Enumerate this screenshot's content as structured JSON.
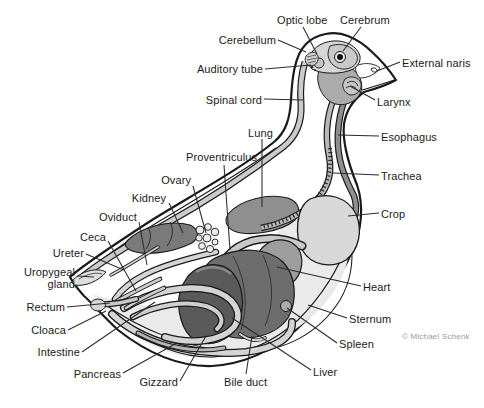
{
  "figure": {
    "credit": "© Michael Schenk"
  },
  "labels": {
    "optic_lobe": "Optic lobe",
    "cerebrum": "Cerebrum",
    "cerebellum": "Cerebellum",
    "auditory_tube": "Auditory tube",
    "external_naris": "External naris",
    "spinal_cord": "Spinal cord",
    "larynx": "Larynx",
    "esophagus": "Esophagus",
    "lung": "Lung",
    "trachea": "Trachea",
    "proventriculus": "Proventriculus",
    "ovary": "Ovary",
    "kidney": "Kidney",
    "crop": "Crop",
    "oviduct": "Oviduct",
    "ceca": "Ceca",
    "ureter": "Ureter",
    "uropygeal_gland": "Uropygeal\ngland",
    "rectum": "Rectum",
    "cloaca": "Cloaca",
    "intestine": "Intestine",
    "pancreas": "Pancreas",
    "gizzard": "Gizzard",
    "bile_duct": "Bile duct",
    "liver": "Liver",
    "spleen": "Spleen",
    "sternum": "Sternum",
    "heart": "Heart"
  },
  "colors": {
    "outline": "#1a1a1a",
    "label_text": "#1a1a1a",
    "credit_text": "#9a9a9a",
    "organ_light": "#d8d8d8",
    "organ_mid": "#9d9d9d",
    "organ_dark": "#5a5a5a",
    "background": "#ffffff"
  }
}
